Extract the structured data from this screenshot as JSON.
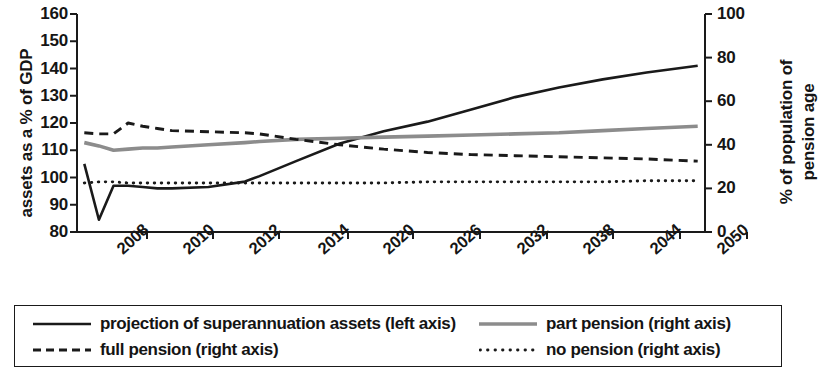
{
  "chart_data": {
    "type": "line",
    "title": "",
    "subtitle": "",
    "xlabel": "",
    "ylabel": "assets as a % of GDP",
    "y2label": "% of population of pension age",
    "grid": false,
    "legend_position": "bottom",
    "xlim": [
      2008,
      2051
    ],
    "ylim": [
      80,
      160
    ],
    "y2lim": [
      0,
      100
    ],
    "y_ticks": [
      80,
      90,
      100,
      110,
      120,
      130,
      140,
      150,
      160
    ],
    "y2_ticks": [
      0,
      20,
      40,
      60,
      80,
      100
    ],
    "x_tick_labels": [
      "2008",
      "2010",
      "2012",
      "2014",
      "2020",
      "2026",
      "2032",
      "2038",
      "2044",
      "2050"
    ],
    "x_tick_positions": [
      147,
      213,
      279,
      348,
      413,
      480,
      547,
      613,
      680,
      747
    ],
    "note_on_x_axis": "tick labels are evenly spaced on the drawing but step 2 years up to 2014 then 6 years thereafter",
    "series": [
      {
        "name": "projection of superannuation assets (left axis)",
        "axis": "left",
        "style": "solid",
        "color": "#1a1a1a",
        "x": [
          2008.5,
          2009.5,
          2010.5,
          2011.5,
          2012.5,
          2013.5,
          2014.5,
          2017,
          2019.5,
          2020.5,
          2023,
          2026,
          2029,
          2032,
          2035,
          2038,
          2041,
          2044,
          2047,
          2050.5
        ],
        "values": [
          105,
          84.5,
          97,
          97,
          96.5,
          96,
          96,
          96.5,
          98.5,
          100.5,
          106,
          112.5,
          117,
          120.5,
          125,
          129.5,
          133,
          136,
          138.5,
          141
        ]
      },
      {
        "name": "part pension (right axis)",
        "axis": "right",
        "style": "solid",
        "color": "#8c8c8c",
        "x": [
          2008.5,
          2009.5,
          2010.5,
          2011.5,
          2012.5,
          2013.5,
          2014.5,
          2017,
          2019.5,
          2020.5,
          2023,
          2026,
          2029,
          2032,
          2035,
          2038,
          2041,
          2044,
          2047,
          2050.5
        ],
        "values": [
          41,
          39.5,
          37.5,
          38,
          38.5,
          38.5,
          39,
          40,
          41,
          41.5,
          42.5,
          43,
          43.5,
          44,
          44.5,
          45,
          45.5,
          46.5,
          47.5,
          48.5
        ]
      },
      {
        "name": "full pension (right axis)",
        "axis": "right",
        "style": "dashed",
        "color": "#1a1a1a",
        "x": [
          2008.5,
          2009.5,
          2010.5,
          2011.5,
          2012.5,
          2013.5,
          2014.5,
          2017,
          2019.5,
          2020.5,
          2023,
          2026,
          2029,
          2032,
          2035,
          2038,
          2041,
          2044,
          2047,
          2050.5
        ],
        "values": [
          45.5,
          45,
          45,
          50,
          48.5,
          47.5,
          46.5,
          46,
          45.5,
          45,
          42.5,
          40,
          38,
          36.5,
          35.5,
          35,
          34.5,
          34,
          33.5,
          32.5
        ]
      },
      {
        "name": "no pension (right axis)",
        "axis": "right",
        "style": "dotted",
        "color": "#1a1a1a",
        "x": [
          2008.5,
          2009.5,
          2010.5,
          2011.5,
          2012.5,
          2013.5,
          2014.5,
          2017,
          2019.5,
          2020.5,
          2023,
          2026,
          2029,
          2032,
          2035,
          2038,
          2041,
          2044,
          2047,
          2050.5
        ],
        "values": [
          22.5,
          23,
          23,
          22.5,
          22.5,
          22.5,
          22.5,
          22.5,
          22.5,
          22.5,
          22.5,
          22.5,
          22.5,
          23,
          23,
          23,
          23,
          23,
          23.5,
          23.5
        ]
      }
    ]
  },
  "axes": {
    "left_title": "assets as a % of GDP",
    "right_title_line1": "% of population of",
    "right_title_line2": "pension age",
    "left_ticks": [
      "160",
      "150",
      "140",
      "130",
      "120",
      "110",
      "100",
      "90",
      "80"
    ],
    "right_ticks": [
      "100",
      "80",
      "60",
      "40",
      "20",
      "0"
    ],
    "x_ticks": [
      "2008",
      "2010",
      "2012",
      "2014",
      "2020",
      "2026",
      "2032",
      "2038",
      "2044",
      "2050"
    ]
  },
  "legend": {
    "entries": [
      {
        "label": "projection of superannuation assets (left axis)",
        "style": "solid",
        "color": "#1a1a1a"
      },
      {
        "label": "part pension (right axis)",
        "style": "solid",
        "color": "#8c8c8c"
      },
      {
        "label": "full pension (right axis)",
        "style": "dashed",
        "color": "#1a1a1a"
      },
      {
        "label": "no pension (right axis)",
        "style": "dotted",
        "color": "#1a1a1a"
      }
    ]
  },
  "colors": {
    "axis": "#1a1a1a",
    "assets_line": "#1a1a1a",
    "part_pension_line": "#8c8c8c",
    "background": "#ffffff"
  }
}
